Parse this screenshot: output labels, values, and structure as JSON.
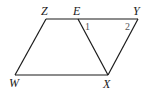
{
  "diagram": {
    "type": "parallelogram",
    "points": {
      "Z": {
        "label": "Z",
        "x": 46,
        "y": 19
      },
      "E": {
        "label": "E",
        "x": 78,
        "y": 19
      },
      "Y": {
        "label": "Y",
        "x": 138,
        "y": 19
      },
      "W": {
        "label": "W",
        "x": 15,
        "y": 75
      },
      "X": {
        "label": "X",
        "x": 108,
        "y": 75
      }
    },
    "segments": [
      "ZY",
      "WX",
      "ZW",
      "EX",
      "YX"
    ],
    "angles": [
      {
        "label": "1",
        "vertex": "E"
      },
      {
        "label": "2",
        "vertex": "Y"
      }
    ],
    "colors": {
      "line": "#1a1a1a",
      "angle_label": "#555555"
    }
  }
}
